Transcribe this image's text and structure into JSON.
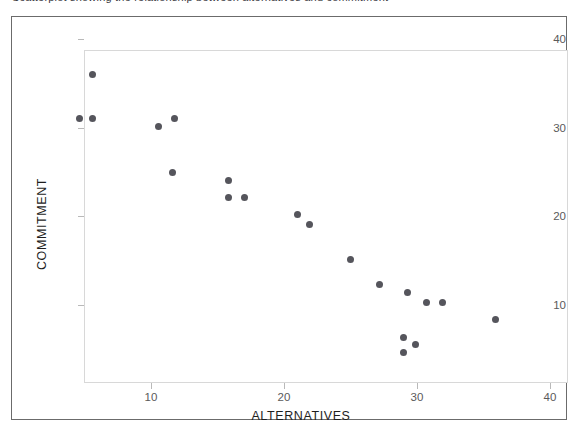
{
  "figure": {
    "caption_partial": "Scatterplot showing the relationship between alternatives and commitment",
    "background_color": "#ffffff",
    "border_color": "#6b6b6b",
    "plot_frame_color": "#d8d8d8"
  },
  "chart_data": {
    "type": "scatter",
    "title": "",
    "xlabel": "ALTERNATIVES",
    "ylabel": "COMMITMENT",
    "xlim": [
      0,
      41
    ],
    "ylim": [
      0,
      41
    ],
    "xticks": [
      10,
      20,
      30,
      40
    ],
    "yticks": [
      10,
      20,
      30,
      40
    ],
    "xtick_labels": [
      "10",
      "20",
      "30",
      "40"
    ],
    "ytick_labels": [
      "10",
      "20",
      "30",
      "40"
    ],
    "grid": false,
    "legend": null,
    "marker_color": "#55555c",
    "marker_size": 7,
    "n_points": 22,
    "correlation": "negative",
    "points": [
      {
        "x": 4.6,
        "y": 31.0
      },
      {
        "x": 5.6,
        "y": 36.0
      },
      {
        "x": 5.6,
        "y": 31.0
      },
      {
        "x": 10.6,
        "y": 30.1
      },
      {
        "x": 11.8,
        "y": 31.0
      },
      {
        "x": 11.6,
        "y": 25.0
      },
      {
        "x": 15.8,
        "y": 24.0
      },
      {
        "x": 15.8,
        "y": 22.1
      },
      {
        "x": 17.0,
        "y": 22.1
      },
      {
        "x": 21.0,
        "y": 20.2
      },
      {
        "x": 21.9,
        "y": 19.1
      },
      {
        "x": 25.0,
        "y": 15.2
      },
      {
        "x": 27.2,
        "y": 12.3
      },
      {
        "x": 29.3,
        "y": 11.4
      },
      {
        "x": 30.7,
        "y": 10.3
      },
      {
        "x": 31.9,
        "y": 10.3
      },
      {
        "x": 35.9,
        "y": 8.4
      },
      {
        "x": 29.0,
        "y": 6.4
      },
      {
        "x": 29.9,
        "y": 5.6
      },
      {
        "x": 29.0,
        "y": 4.7
      }
    ]
  }
}
